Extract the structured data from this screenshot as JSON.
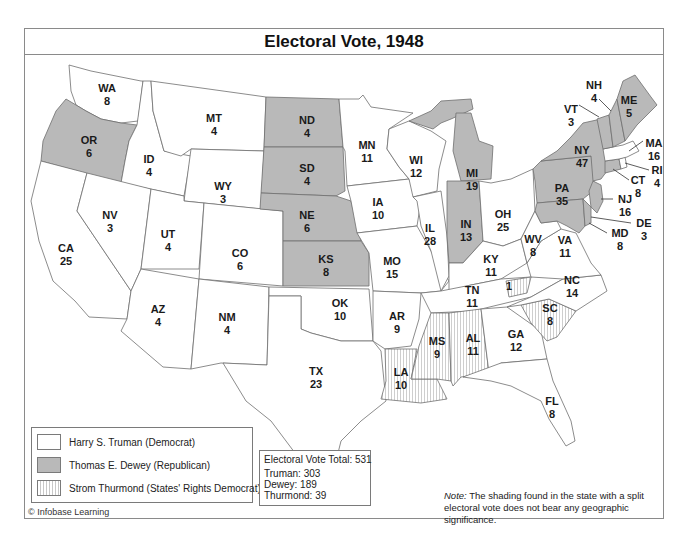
{
  "title": "Electoral Vote, 1948",
  "colors": {
    "truman": "#ffffff",
    "dewey": "#b9b9b9",
    "thurmond_hatch": "#c8c8c8",
    "border": "#6e6e6e"
  },
  "legend": {
    "items": [
      {
        "key": "truman",
        "label": "Harry S. Truman (Democrat)"
      },
      {
        "key": "dewey",
        "label": "Thomas E. Dewey (Republican)"
      },
      {
        "key": "thurmond",
        "label": "Strom Thurmond (States' Rights Democrat)"
      }
    ]
  },
  "totals": {
    "header": "Electoral Vote Total: 531",
    "truman": "Truman: 303",
    "dewey": "Dewey: 189",
    "thurmond": "Thurmond: 39"
  },
  "note": {
    "prefix": "Note:",
    "text": " The shading found in the state with a split electoral vote does not bear any geographic significance."
  },
  "credit": "© Infobase Learning",
  "states": {
    "WA": {
      "abbr": "WA",
      "votes": "8",
      "winner": "truman"
    },
    "OR": {
      "abbr": "OR",
      "votes": "6",
      "winner": "dewey"
    },
    "CA": {
      "abbr": "CA",
      "votes": "25",
      "winner": "truman"
    },
    "ID": {
      "abbr": "ID",
      "votes": "4",
      "winner": "truman"
    },
    "NV": {
      "abbr": "NV",
      "votes": "3",
      "winner": "truman"
    },
    "MT": {
      "abbr": "MT",
      "votes": "4",
      "winner": "truman"
    },
    "WY": {
      "abbr": "WY",
      "votes": "3",
      "winner": "truman"
    },
    "UT": {
      "abbr": "UT",
      "votes": "4",
      "winner": "truman"
    },
    "CO": {
      "abbr": "CO",
      "votes": "6",
      "winner": "truman"
    },
    "AZ": {
      "abbr": "AZ",
      "votes": "4",
      "winner": "truman"
    },
    "NM": {
      "abbr": "NM",
      "votes": "4",
      "winner": "truman"
    },
    "ND": {
      "abbr": "ND",
      "votes": "4",
      "winner": "dewey"
    },
    "SD": {
      "abbr": "SD",
      "votes": "4",
      "winner": "dewey"
    },
    "NE": {
      "abbr": "NE",
      "votes": "6",
      "winner": "dewey"
    },
    "KS": {
      "abbr": "KS",
      "votes": "8",
      "winner": "dewey"
    },
    "OK": {
      "abbr": "OK",
      "votes": "10",
      "winner": "truman"
    },
    "TX": {
      "abbr": "TX",
      "votes": "23",
      "winner": "truman"
    },
    "MN": {
      "abbr": "MN",
      "votes": "11",
      "winner": "truman"
    },
    "IA": {
      "abbr": "IA",
      "votes": "10",
      "winner": "truman"
    },
    "MO": {
      "abbr": "MO",
      "votes": "15",
      "winner": "truman"
    },
    "AR": {
      "abbr": "AR",
      "votes": "9",
      "winner": "truman"
    },
    "LA": {
      "abbr": "LA",
      "votes": "10",
      "winner": "thurmond"
    },
    "WI": {
      "abbr": "WI",
      "votes": "12",
      "winner": "truman"
    },
    "IL": {
      "abbr": "IL",
      "votes": "28",
      "winner": "truman"
    },
    "MI": {
      "abbr": "MI",
      "votes": "19",
      "winner": "dewey"
    },
    "IN": {
      "abbr": "IN",
      "votes": "13",
      "winner": "dewey"
    },
    "OH": {
      "abbr": "OH",
      "votes": "25",
      "winner": "truman"
    },
    "KY": {
      "abbr": "KY",
      "votes": "11",
      "winner": "truman"
    },
    "TN": {
      "abbr": "TN",
      "votes": "11",
      "winner": "truman",
      "split_votes": "1"
    },
    "MS": {
      "abbr": "MS",
      "votes": "9",
      "winner": "thurmond"
    },
    "AL": {
      "abbr": "AL",
      "votes": "11",
      "winner": "thurmond"
    },
    "GA": {
      "abbr": "GA",
      "votes": "12",
      "winner": "truman"
    },
    "FL": {
      "abbr": "FL",
      "votes": "8",
      "winner": "truman"
    },
    "SC": {
      "abbr": "SC",
      "votes": "8",
      "winner": "thurmond"
    },
    "NC": {
      "abbr": "NC",
      "votes": "14",
      "winner": "truman"
    },
    "VA": {
      "abbr": "VA",
      "votes": "11",
      "winner": "truman"
    },
    "WV": {
      "abbr": "WV",
      "votes": "8",
      "winner": "truman"
    },
    "PA": {
      "abbr": "PA",
      "votes": "35",
      "winner": "dewey"
    },
    "NY": {
      "abbr": "NY",
      "votes": "47",
      "winner": "dewey"
    },
    "NJ": {
      "abbr": "NJ",
      "votes": "16",
      "winner": "dewey"
    },
    "DE": {
      "abbr": "DE",
      "votes": "3",
      "winner": "dewey"
    },
    "MD": {
      "abbr": "MD",
      "votes": "8",
      "winner": "dewey"
    },
    "VT": {
      "abbr": "VT",
      "votes": "3",
      "winner": "dewey"
    },
    "NH": {
      "abbr": "NH",
      "votes": "4",
      "winner": "dewey"
    },
    "ME": {
      "abbr": "ME",
      "votes": "5",
      "winner": "dewey"
    },
    "MA": {
      "abbr": "MA",
      "votes": "16",
      "winner": "truman"
    },
    "RI": {
      "abbr": "RI",
      "votes": "4",
      "winner": "truman"
    },
    "CT": {
      "abbr": "CT",
      "votes": "8",
      "winner": "dewey"
    }
  }
}
